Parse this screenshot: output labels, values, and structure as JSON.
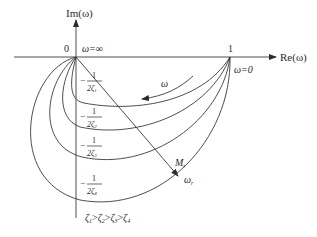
{
  "diagram": {
    "axes": {
      "x_label": "Re(ω)",
      "y_label": "Im(ω)",
      "origin_label": "0",
      "unit_point_label": "1"
    },
    "annotations": {
      "omega_inf": "ω=∞",
      "omega_zero": "ω=0",
      "omega_dir": "ω",
      "Mr": "M",
      "Mr_sub": "r",
      "omega_r": "ω",
      "omega_r_sub": "r"
    },
    "intercepts": [
      {
        "num": "1",
        "den": "2ζ",
        "sub": "1",
        "sign": "−"
      },
      {
        "num": "1",
        "den": "2ζ",
        "sub": "2",
        "sign": "−"
      },
      {
        "num": "1",
        "den": "2ζ",
        "sub": "3",
        "sign": "−"
      },
      {
        "num": "1",
        "den": "2ζ",
        "sub": "4",
        "sign": "−"
      }
    ],
    "relation": {
      "z": "ζ",
      "subs": [
        "1",
        "2",
        "3",
        "4"
      ],
      "op": ">"
    },
    "colors": {
      "stroke": "#3a3a3a",
      "text": "#2b2b2b",
      "background": "#ffffff"
    }
  }
}
